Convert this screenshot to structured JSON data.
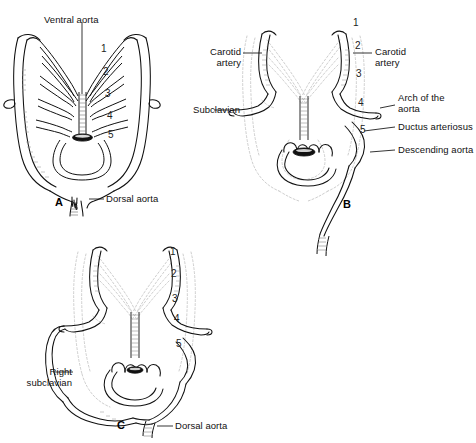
{
  "figure": {
    "type": "anatomical-line-diagram",
    "ink_color": "#111111",
    "background_color": "#ffffff",
    "faint_color": "#b9b9b9",
    "panels": [
      {
        "id": "A",
        "letter": "A",
        "arch_numbers": [
          "1",
          "2",
          "3",
          "4",
          "5"
        ],
        "labels": [
          {
            "name": "ventral-aorta",
            "text": "Ventral aorta"
          },
          {
            "name": "dorsal-aorta",
            "text": "Dorsal aorta"
          }
        ]
      },
      {
        "id": "B",
        "letter": "B",
        "arch_numbers": [
          "1",
          "2",
          "3",
          "4",
          "5"
        ],
        "labels": [
          {
            "name": "carotid-artery-left",
            "text": "Carotid\nartery"
          },
          {
            "name": "carotid-artery-right",
            "text": "Carotid\nartery"
          },
          {
            "name": "subclavian",
            "text": "Subclavian"
          },
          {
            "name": "arch-of-the-aorta",
            "text": "Arch of the\naorta"
          },
          {
            "name": "ductus-arteriosus",
            "text": "Ductus arteriosus"
          },
          {
            "name": "descending-aorta",
            "text": "Descending aorta"
          }
        ]
      },
      {
        "id": "C",
        "letter": "C",
        "arch_numbers": [
          "1",
          "2",
          "3",
          "4",
          "5"
        ],
        "labels": [
          {
            "name": "right-subclavian",
            "text": "Right\nsubclavian"
          },
          {
            "name": "dorsal-aorta",
            "text": "Dorsal aorta"
          }
        ]
      }
    ]
  },
  "panelA": {
    "letter": "A",
    "ventral_aorta": "Ventral aorta",
    "dorsal_aorta": "Dorsal aorta",
    "n1": "1",
    "n2": "2",
    "n3": "3",
    "n4": "4",
    "n5": "5"
  },
  "panelB": {
    "letter": "B",
    "carotid_left": "Carotid\nartery",
    "carotid_right": "Carotid\nartery",
    "subclavian": "Subclavian",
    "arch_of_aorta": "Arch of the\naorta",
    "ductus_arteriosus": "Ductus arteriosus",
    "descending_aorta": "Descending aorta",
    "n1": "1",
    "n2": "2",
    "n3": "3",
    "n4": "4",
    "n5": "5"
  },
  "panelC": {
    "letter": "C",
    "right_subclavian": "Right\nsubclavian",
    "dorsal_aorta": "Dorsal aorta",
    "n1": "1",
    "n2": "2",
    "n3": "3",
    "n4": "4",
    "n5": "5"
  }
}
